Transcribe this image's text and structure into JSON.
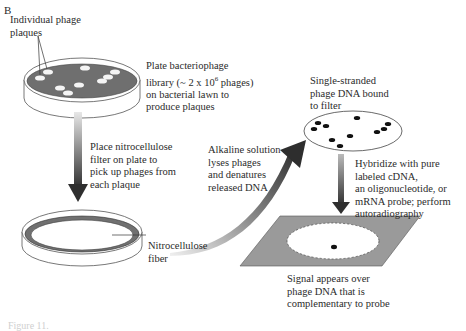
{
  "panel_label": "B",
  "labels": {
    "plaques": "Individual phage\nplaques",
    "plate_library": "Plate bacteriophage\nlibrary (~ 2 x 10",
    "plate_exp": "6",
    "plate_library_rest": " phages)\non bacterial lawn to\nproduce plaques",
    "place_filter": "Place nitrocellulose\nfilter on plate to\npick up phages from\neach plaque",
    "nitrocellulose": "Nitrocellulose\nfiber",
    "alkaline": "Alkaline solution\nlyses phages\nand denatures\nreleased DNA",
    "single_stranded": "Single-stranded\nphage DNA bound\nto filter",
    "hybridize": "Hybridize with pure\nlabeled cDNA,\nan oligonucleotide, or\nmRNA probe; perform\nautoradiography",
    "signal": "Signal appears over\nphage DNA that is\ncomplementary to probe"
  },
  "caption": "Figure 11.",
  "colors": {
    "lawn": "#6f6f6f",
    "arrow_dark": "#3a3a3a",
    "film": "#9a9a9a",
    "dot": "#111111"
  }
}
